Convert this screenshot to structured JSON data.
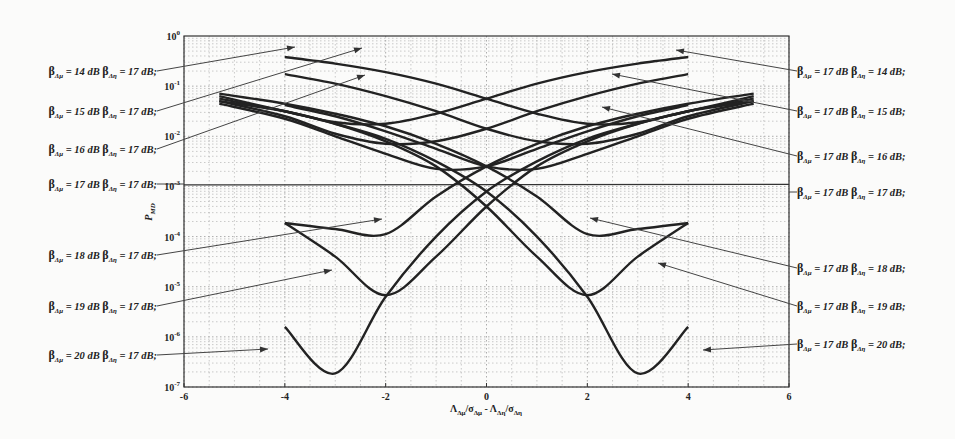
{
  "chart_data": {
    "type": "line",
    "title": "",
    "xlabel": "Λ_Δμ/σ_Δμ - Λ_Δη/σ_Δη",
    "ylabel": "P_MD",
    "xlim": [
      -6,
      6
    ],
    "ylim": [
      1e-07,
      1
    ],
    "yscale": "log",
    "grid": true,
    "x_ticks": [
      "-6",
      "-4",
      "-2",
      "0",
      "2",
      "4",
      "6"
    ],
    "y_ticks": [
      "10^0",
      "10^-1",
      "10^-2",
      "10^-3",
      "10^-4",
      "10^-5",
      "10^-6",
      "10^-7"
    ],
    "x": [
      -4,
      -3,
      -2,
      -1,
      0,
      1,
      2,
      3,
      4,
      5.3
    ],
    "series": [
      {
        "name": "β_Δμ = 14 dB β_Δη = 17 dB",
        "side": "left",
        "log10_values": [
          -0.42,
          -0.55,
          -0.72,
          -0.95,
          -1.25,
          -1.55,
          -1.75,
          -1.72,
          -1.5,
          -1.2
        ]
      },
      {
        "name": "β_Δμ = 15 dB β_Δη = 17 dB",
        "side": "left",
        "log10_values": [
          -0.76,
          -0.95,
          -1.2,
          -1.5,
          -1.85,
          -2.1,
          -2.15,
          -1.95,
          -1.6,
          -1.3
        ]
      },
      {
        "name": "β_Δμ = 16 dB β_Δη = 17 dB",
        "side": "left",
        "log10_values": [
          -1.38,
          -1.6,
          -1.9,
          -2.25,
          -2.6,
          -2.65,
          -2.35,
          -2.0,
          -1.65,
          -1.35
        ]
      },
      {
        "name": "β_Δμ = 17 dB β_Δη = 17 dB",
        "side": "both",
        "log10_values": [
          -2.97,
          -2.98,
          -3.0,
          -3.02,
          -3.05,
          -3.02,
          -3.0,
          -2.98,
          -2.97,
          -2.96
        ]
      },
      {
        "name": "β_Δμ = 18 dB β_Δη = 17 dB",
        "side": "left",
        "log10_values": [
          -3.73,
          -3.85,
          -3.95,
          -3.2,
          -2.6,
          -2.15,
          -1.8,
          -1.55,
          -1.35,
          -1.15
        ]
      },
      {
        "name": "β_Δμ = 19 dB β_Δη = 17 dB",
        "side": "left",
        "log10_values": [
          -3.73,
          -4.4,
          -5.17,
          -4.4,
          -3.4,
          -2.6,
          -2.1,
          -1.75,
          -1.5,
          -1.25
        ]
      },
      {
        "name": "β_Δμ = 20 dB β_Δη = 17 dB",
        "side": "left",
        "log10_values": [
          -5.8,
          -6.73,
          -5.2,
          -4.0,
          -3.1,
          -2.5,
          -2.05,
          -1.75,
          -1.5,
          -1.3
        ]
      },
      {
        "name": "β_Δμ = 17 dB β_Δη = 14 dB",
        "side": "right",
        "mirror_of": "β_Δμ = 14 dB β_Δη = 17 dB"
      },
      {
        "name": "β_Δμ = 17 dB β_Δη = 15 dB",
        "side": "right",
        "mirror_of": "β_Δμ = 15 dB β_Δη = 17 dB"
      },
      {
        "name": "β_Δμ = 17 dB β_Δη = 16 dB",
        "side": "right",
        "mirror_of": "β_Δμ = 16 dB β_Δη = 17 dB"
      },
      {
        "name": "β_Δμ = 17 dB β_Δη = 18 dB",
        "side": "right",
        "mirror_of": "β_Δμ = 18 dB β_Δη = 17 dB"
      },
      {
        "name": "β_Δμ = 17 dB β_Δη = 19 dB",
        "side": "right",
        "mirror_of": "β_Δμ = 19 dB β_Δη = 17 dB"
      },
      {
        "name": "β_Δμ = 17 dB β_Δη = 20 dB",
        "side": "right",
        "mirror_of": "β_Δμ = 20 dB β_Δη = 17 dB"
      }
    ],
    "annotations": {
      "left": [
        {
          "text": "β_Δμ = 14 dB β_Δη = 17 dB;",
          "y": 71,
          "target": [
            295,
            47
          ]
        },
        {
          "text": "β_Δμ = 15 dB β_Δη = 17 dB;",
          "y": 111,
          "target": [
            362,
            48
          ]
        },
        {
          "text": "β_Δμ = 16 dB β_Δη = 17 dB;",
          "y": 149,
          "target": [
            365,
            75
          ]
        },
        {
          "text": "β_Δμ = 17 dB β_Δη = 17 dB;",
          "y": 184,
          "target": [
            184,
            184
          ]
        },
        {
          "text": "β_Δμ = 18 dB β_Δη = 17 dB;",
          "y": 255,
          "target": [
            382,
            219
          ]
        },
        {
          "text": "β_Δμ = 19 dB β_Δη = 17 dB;",
          "y": 306,
          "target": [
            332,
            270
          ]
        },
        {
          "text": "β_Δμ = 20 dB β_Δη = 17 dB;",
          "y": 355,
          "target": [
            268,
            349
          ]
        }
      ],
      "right": [
        {
          "text": "β_Δμ = 17 dB β_Δη = 14 dB;",
          "y": 71,
          "target": [
            676,
            50
          ]
        },
        {
          "text": "β_Δμ = 17 dB β_Δη = 15 dB;",
          "y": 111,
          "target": [
            612,
            74
          ]
        },
        {
          "text": "β_Δμ = 17 dB β_Δη = 16 dB;",
          "y": 156,
          "target": [
            602,
            107
          ]
        },
        {
          "text": "β_Δμ = 17 dB β_Δη = 17 dB;",
          "y": 192,
          "target": [
            789,
            192
          ]
        },
        {
          "text": "β_Δμ = 17 dB β_Δη = 18 dB;",
          "y": 268,
          "target": [
            590,
            218
          ]
        },
        {
          "text": "β_Δμ = 17 dB β_Δη = 19 dB;",
          "y": 306,
          "target": [
            658,
            263
          ]
        },
        {
          "text": "β_Δμ = 17 dB β_Δη = 20 dB;",
          "y": 344,
          "target": [
            703,
            350
          ]
        }
      ]
    }
  }
}
